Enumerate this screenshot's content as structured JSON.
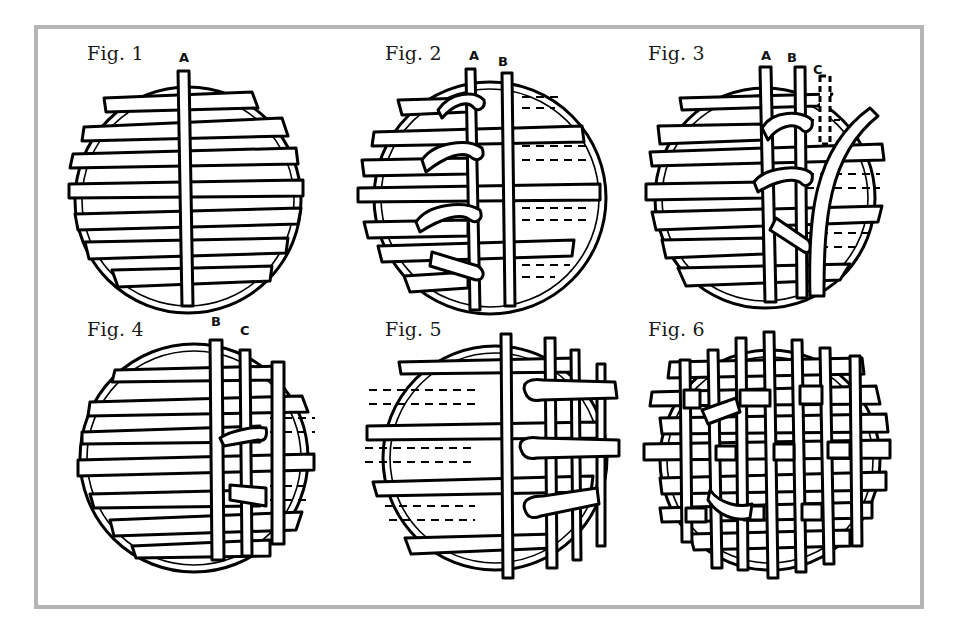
{
  "diagram": {
    "type": "instructional-illustration",
    "layout": {
      "rows": 2,
      "cols": 3
    },
    "frame_color": "#b5b5b5",
    "figures": [
      {
        "id": "fig1",
        "label": "Fig. 1",
        "strand_labels": [
          "A"
        ],
        "description": "Horizontal strips laid across hoop with one vertical strip A"
      },
      {
        "id": "fig2",
        "label": "Fig. 2",
        "strand_labels": [
          "A",
          "B"
        ],
        "description": "Alternate strips folded back over A, vertical strip B added"
      },
      {
        "id": "fig3",
        "label": "Fig. 3",
        "strand_labels": [
          "A",
          "B",
          "C"
        ],
        "description": "Strips folded back over B, strip C being inserted"
      },
      {
        "id": "fig4",
        "label": "Fig. 4",
        "strand_labels": [
          "B",
          "C"
        ],
        "description": "Weaving continues with strips B and C on right side"
      },
      {
        "id": "fig5",
        "label": "Fig. 5",
        "strand_labels": [],
        "description": "Right half woven, left side strips shown dashed"
      },
      {
        "id": "fig6",
        "label": "Fig. 6",
        "strand_labels": [],
        "description": "Completed lattice weave across the hoop"
      }
    ]
  }
}
